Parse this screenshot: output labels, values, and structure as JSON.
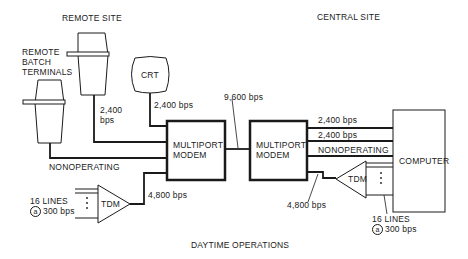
{
  "diagram": {
    "caption": "DAYTIME OPERATIONS",
    "sites": {
      "remote": "REMOTE SITE",
      "central": "CENTRAL SITE"
    },
    "nodes": {
      "remote_batch_terminals": [
        "REMOTE",
        "BATCH",
        "TERMINALS"
      ],
      "crt": "CRT",
      "modem_remote": [
        "MULTIPORT",
        "MODEM"
      ],
      "modem_central": [
        "MULTIPORT",
        "MODEM"
      ],
      "tdm_remote": "TDM",
      "tdm_central": "TDM",
      "computer": "COMPUTER"
    },
    "links": {
      "terminal_to_modem": [
        "2,400",
        "bps"
      ],
      "crt_to_modem": "2,400 bps",
      "nonoperating_remote": "NONOPERATING",
      "modem_to_modem": "9,600 bps",
      "tdm_to_modem_remote": "4,800 bps",
      "central_line_1": "2,400 bps",
      "central_line_2": "2,400 bps",
      "nonoperating_central": "NONOPERATING",
      "tdm_to_modem_central": "4,800 bps"
    },
    "tdm_inputs_remote": {
      "lines": "16 LINES",
      "at": "a",
      "rate": "300 bps"
    },
    "tdm_inputs_central": {
      "lines": "16 LINES",
      "at": "a",
      "rate": "300 bps"
    },
    "colors": {
      "ink": "#1a1a1a",
      "background": "#ffffff"
    }
  }
}
